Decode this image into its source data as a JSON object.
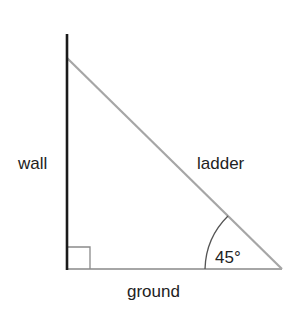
{
  "diagram": {
    "labels": {
      "wall": "wall",
      "ladder": "ladder",
      "ground": "ground",
      "angle": "45°"
    },
    "colors": {
      "wall": "#1a1a1a",
      "ladder": "#a6a6a6",
      "ground": "#a6a6a6",
      "text": "#222222"
    }
  }
}
